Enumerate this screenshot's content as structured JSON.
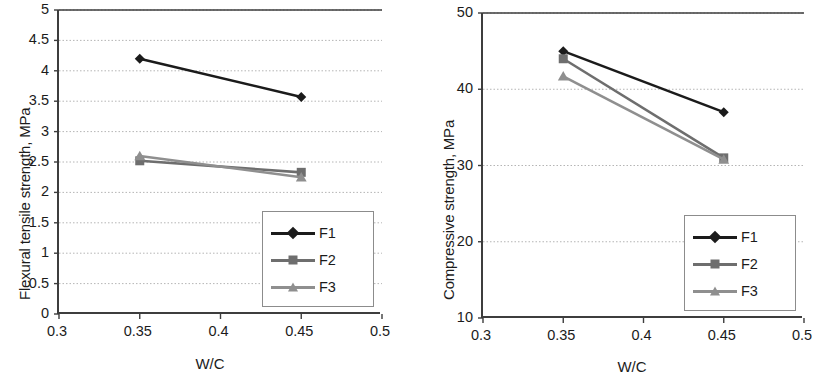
{
  "chart_data": [
    {
      "id": "flexural",
      "type": "line",
      "title": "",
      "xlabel": "W/C",
      "ylabel": "Flexural tensile strength, MPa",
      "xlim": [
        0.3,
        0.5
      ],
      "ylim": [
        0,
        5
      ],
      "xticks": [
        "0.3",
        "0.35",
        "0.4",
        "0.45",
        "0.5"
      ],
      "xtick_values": [
        0.3,
        0.35,
        0.4,
        0.45,
        0.5
      ],
      "yticks": [
        "0",
        "0.5",
        "1",
        "1.5",
        "2",
        "2.5",
        "3",
        "3.5",
        "4",
        "4.5",
        "5"
      ],
      "ytick_values": [
        0,
        0.5,
        1,
        1.5,
        2,
        2.5,
        3,
        3.5,
        4,
        4.5,
        5
      ],
      "grid": "horizontal-dotted",
      "legend_position": "bottom-right",
      "x": [
        0.35,
        0.45
      ],
      "series": [
        {
          "name": "F1",
          "marker": "diamond",
          "color": "#1b1b1b",
          "values": [
            4.2,
            3.57
          ]
        },
        {
          "name": "F2",
          "marker": "square",
          "color": "#6e6e6e",
          "values": [
            2.52,
            2.33
          ]
        },
        {
          "name": "F3",
          "marker": "triangle",
          "color": "#8f8f8f",
          "values": [
            2.6,
            2.25
          ]
        }
      ]
    },
    {
      "id": "compressive",
      "type": "line",
      "title": "",
      "xlabel": "W/C",
      "ylabel": "Compressive strength, MPa",
      "xlim": [
        0.3,
        0.5
      ],
      "ylim": [
        10,
        50
      ],
      "xticks": [
        "0.3",
        "0.35",
        "0.4",
        "0.45",
        "0.5"
      ],
      "xtick_values": [
        0.3,
        0.35,
        0.4,
        0.45,
        0.5
      ],
      "yticks": [
        "10",
        "20",
        "30",
        "40",
        "50"
      ],
      "ytick_values": [
        10,
        20,
        30,
        40,
        50
      ],
      "grid": "horizontal-dotted",
      "legend_position": "bottom-right",
      "x": [
        0.35,
        0.45
      ],
      "series": [
        {
          "name": "F1",
          "marker": "diamond",
          "color": "#1b1b1b",
          "values": [
            45.0,
            37.0
          ]
        },
        {
          "name": "F2",
          "marker": "square",
          "color": "#6e6e6e",
          "values": [
            44.0,
            31.0
          ]
        },
        {
          "name": "F3",
          "marker": "triangle",
          "color": "#8f8f8f",
          "values": [
            41.7,
            30.8
          ]
        }
      ]
    }
  ],
  "figures": {
    "left": {
      "name": "flexural-tensile-strength-chart",
      "plot": {
        "x": 57,
        "y": 10,
        "w": 323,
        "h": 304
      },
      "ylabel_pos": {
        "x": 16,
        "y": 300
      },
      "xlabel_pos": {
        "x": 170,
        "y": 355
      }
    },
    "right": {
      "name": "compressive-strength-chart",
      "plot": {
        "x": 71,
        "y": 13,
        "w": 321,
        "h": 305
      },
      "ylabel_pos": {
        "x": 30,
        "y": 300
      },
      "xlabel_pos": {
        "x": 182,
        "y": 358
      }
    }
  },
  "colors": {
    "axis": "#3d3d3d",
    "grid": "#b5b5b5",
    "legend_border": "#8c8c8c",
    "text": "#1b1b1b",
    "background": "#ffffff"
  }
}
